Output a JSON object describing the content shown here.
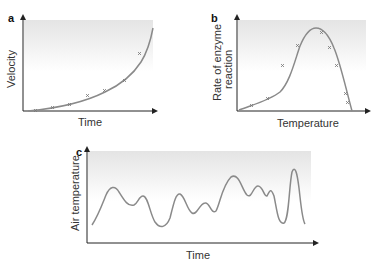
{
  "panels": [
    {
      "id": "a",
      "letter": "a",
      "xlabel": "Time",
      "ylabel": "Velocity",
      "curve": "exponential",
      "markers": "x"
    },
    {
      "id": "b",
      "letter": "b",
      "xlabel": "Temperature",
      "ylabel_line1": "Rate of enzyme",
      "ylabel_line2": "reaction",
      "curve": "bell-shaped peak then steep drop",
      "markers": "x"
    },
    {
      "id": "c",
      "letter": "c",
      "xlabel": "Time",
      "ylabel": "Air temperature",
      "curve": "irregular fluctuation"
    }
  ],
  "colors": {
    "curve": "#8a8a8a",
    "axis": "#222222",
    "shade_top": "#e6e6e6",
    "shade_bottom": "#ffffff"
  }
}
